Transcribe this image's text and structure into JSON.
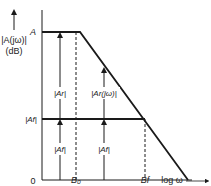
{
  "diagram": {
    "y_axis_label_line1": "|A(jω)|",
    "y_axis_label_line2": "(dB)",
    "x_axis_label": "log ω",
    "origin_label": "0",
    "levels": {
      "open_loop_gain": "A",
      "closed_loop_gain": "|Af|"
    },
    "frequencies": {
      "open_loop_bandwidth": "B₀",
      "closed_loop_bandwidth": "Bf"
    },
    "annotations": {
      "return_ratio_low": "|Ar|",
      "closed_loop_low": "|Af|",
      "return_ratio_jw": "|Ar(jω)|",
      "closed_loop_mid": "|Af|"
    },
    "colors": {
      "line": "#1a1a1a",
      "text": "#222222"
    }
  }
}
